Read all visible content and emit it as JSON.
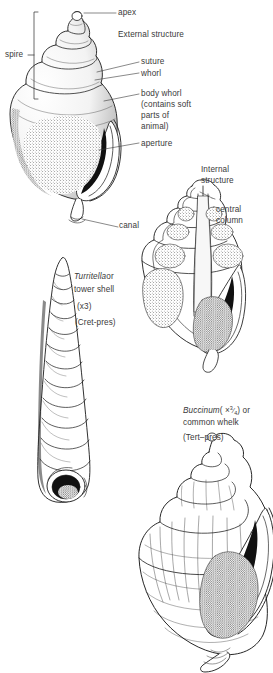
{
  "figure": {
    "title_implicit": "Gastropod shell structure",
    "background_color": "#ffffff",
    "ink_color": "#1a1a1a",
    "label_color": "#3a3a3a"
  },
  "sections": {
    "external": {
      "heading": "External structure",
      "labels": [
        {
          "name": "apex",
          "text": "apex"
        },
        {
          "name": "spire",
          "text": "spire"
        },
        {
          "name": "suture",
          "text": "suture"
        },
        {
          "name": "whorl",
          "text": "whorl"
        },
        {
          "name": "body-whorl",
          "text": "body whorl"
        },
        {
          "name": "body-whorl-note-1",
          "text": "(contains soft"
        },
        {
          "name": "body-whorl-note-2",
          "text": "parts of"
        },
        {
          "name": "body-whorl-note-3",
          "text": "animal)"
        },
        {
          "name": "aperture",
          "text": "aperture"
        },
        {
          "name": "canal",
          "text": "canal"
        }
      ]
    },
    "internal": {
      "heading_line_1": "Internal",
      "heading_line_2": "structure",
      "labels": [
        {
          "name": "central-column-line-1",
          "text": "central"
        },
        {
          "name": "central-column-line-2",
          "text": "column"
        }
      ]
    },
    "turritella": {
      "genus": "Turritella",
      "conjunction": "or",
      "common_name": "tower shell",
      "magnification": "(x3)",
      "range": "(Cret-pres)"
    },
    "buccinum": {
      "genus": "Buccinum",
      "magnification_open": "( ×",
      "magnification_num": "3",
      "magnification_den": "4",
      "magnification_close": ") or",
      "common_name": "common whelk",
      "range": "(Tert–pres)"
    }
  }
}
